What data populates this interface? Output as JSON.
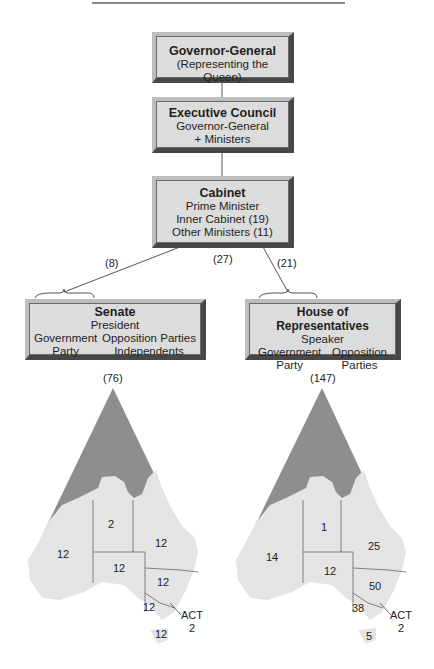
{
  "diagram": {
    "nodes": {
      "governor_general": {
        "title": "Governor-General",
        "lines": [
          "(Representing the Queen)"
        ]
      },
      "executive_council": {
        "title": "Executive Council",
        "lines": [
          "Governor-General",
          "+ Ministers"
        ]
      },
      "cabinet": {
        "title": "Cabinet",
        "lines": [
          "Prime Minister",
          "Inner Cabinet (19)",
          "Other Ministers (11)"
        ]
      },
      "senate": {
        "title": "Senate",
        "presiding": "President",
        "left_col": [
          "Government",
          "Party"
        ],
        "right_col": [
          "Opposition Parties",
          "Independents"
        ],
        "total": "(76)"
      },
      "house": {
        "title": "House of Representatives",
        "presiding": "Speaker",
        "left_col": [
          "Government",
          "Party"
        ],
        "right_col": [
          "Opposition",
          "Parties"
        ],
        "total": "(147)"
      }
    },
    "edge_labels": {
      "senate_ministers": "(8)",
      "total_ministers": "(27)",
      "house_ministers": "(21)"
    },
    "maps": {
      "senate": {
        "states": [
          {
            "name": "WA",
            "seats": "12"
          },
          {
            "name": "NT",
            "seats": "2"
          },
          {
            "name": "QLD",
            "seats": "12"
          },
          {
            "name": "SA",
            "seats": "12"
          },
          {
            "name": "NSW",
            "seats": "12"
          },
          {
            "name": "VIC",
            "seats": "12"
          },
          {
            "name": "TAS",
            "seats": "12"
          },
          {
            "name": "ACT",
            "seats": "2"
          }
        ]
      },
      "house": {
        "states": [
          {
            "name": "WA",
            "seats": "14"
          },
          {
            "name": "NT",
            "seats": "1"
          },
          {
            "name": "QLD",
            "seats": "25"
          },
          {
            "name": "SA",
            "seats": "12"
          },
          {
            "name": "NSW",
            "seats": "50"
          },
          {
            "name": "VIC",
            "seats": "38"
          },
          {
            "name": "TAS",
            "seats": "5"
          },
          {
            "name": "ACT",
            "seats": "2"
          }
        ]
      },
      "act_label": "ACT"
    },
    "colors": {
      "box_fill": "#dcdcdc",
      "box_dark": "#474747",
      "sea": "#8e8e8e",
      "land": "#e4e4e4"
    }
  }
}
